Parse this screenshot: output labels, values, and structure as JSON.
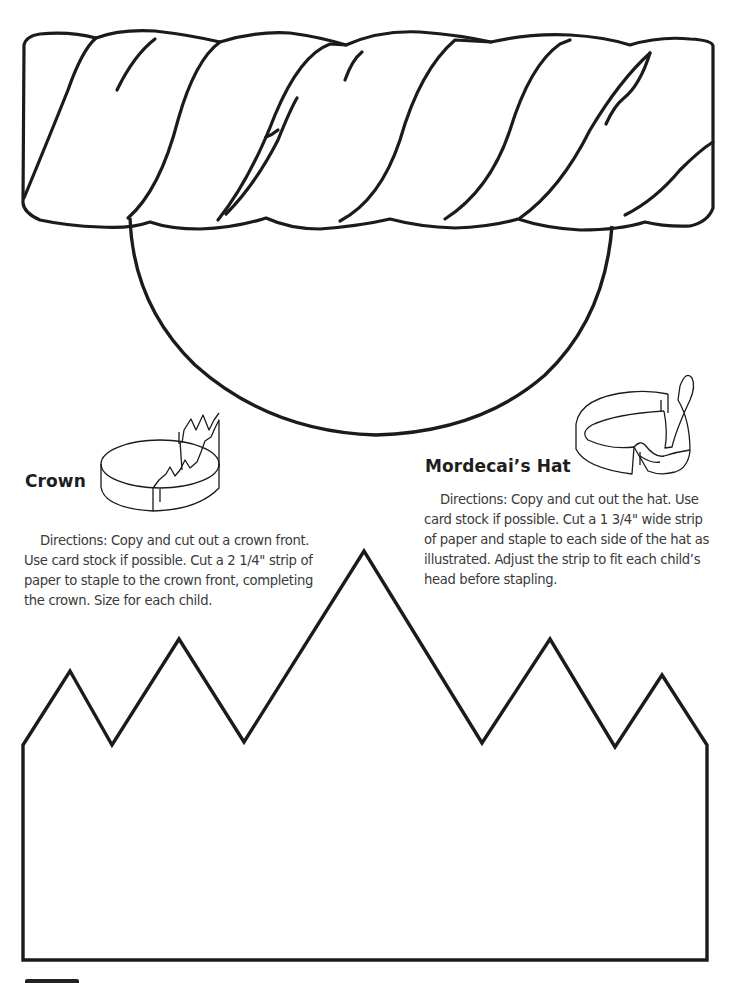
{
  "page": {
    "type": "craft-template",
    "colors": {
      "ink": "#1a1a1a",
      "text": "#3a3a3a",
      "paper": "#ffffff"
    }
  },
  "hat_template": {
    "name": "mordecai-hat-cutout",
    "parts": [
      "twisted-band",
      "dome"
    ]
  },
  "crown": {
    "title": "Crown",
    "directions": "Directions: Copy and cut out a crown front. Use card stock if possible. Cut a 2 1/4\" strip of paper to staple to the crown front, completing the crown. Size for each child.",
    "directions_lines": [
      "Directions: Copy and cut out a crown front.",
      "Use card stock if possible. Cut a 2 1/4\" strip of",
      "paper to staple to the crown front, completing",
      "the crown. Size for each child."
    ],
    "illustration": "assembled-crown-icon"
  },
  "mordecai_hat": {
    "title": "Mordecai’s Hat",
    "directions": "Directions: Copy and cut out the hat. Use card stock if possible. Cut a 1 3/4\" wide strip of paper and staple to each side of the hat as illustrated. Adjust the strip to fit each child’s head before stapling.",
    "directions_lines": [
      "Directions: Copy and cut out the hat. Use",
      "card stock if possible. Cut a 1 3/4\" wide strip",
      "of paper and staple to each side of the hat as",
      "illustrated. Adjust the strip to fit each child’s",
      "head before stapling."
    ],
    "illustration": "assembled-hat-icon"
  },
  "crown_template": {
    "name": "crown-front-cutout",
    "points": 5
  }
}
